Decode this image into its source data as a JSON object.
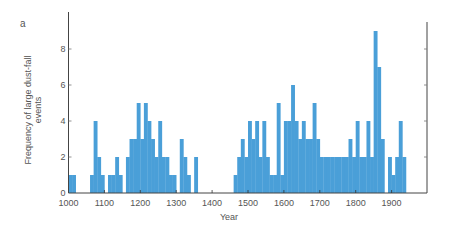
{
  "panel_label": "a",
  "chart_data": {
    "type": "bar",
    "title": "",
    "xlabel": "Year",
    "ylabel": "Frequency of large dust-fall events",
    "xlim": [
      1000,
      2000
    ],
    "ylim": [
      0,
      10
    ],
    "bin_width_years": 10,
    "x_ticks": [
      1000,
      1100,
      1200,
      1300,
      1400,
      1500,
      1600,
      1700,
      1800,
      1900
    ],
    "y_ticks": [
      0,
      2,
      4,
      6,
      8
    ],
    "grid": false,
    "legend": null,
    "color": "#4a9fd8",
    "x": [
      1000,
      1010,
      1020,
      1030,
      1040,
      1050,
      1060,
      1070,
      1080,
      1090,
      1100,
      1110,
      1120,
      1130,
      1140,
      1150,
      1160,
      1170,
      1180,
      1190,
      1200,
      1210,
      1220,
      1230,
      1240,
      1250,
      1260,
      1270,
      1280,
      1290,
      1300,
      1310,
      1320,
      1330,
      1340,
      1350,
      1360,
      1370,
      1380,
      1390,
      1400,
      1410,
      1420,
      1430,
      1440,
      1450,
      1460,
      1470,
      1480,
      1490,
      1500,
      1510,
      1520,
      1530,
      1540,
      1550,
      1560,
      1570,
      1580,
      1590,
      1600,
      1610,
      1620,
      1630,
      1640,
      1650,
      1660,
      1670,
      1680,
      1690,
      1700,
      1710,
      1720,
      1730,
      1740,
      1750,
      1760,
      1770,
      1780,
      1790,
      1800,
      1810,
      1820,
      1830,
      1840,
      1850,
      1860,
      1870,
      1880,
      1890,
      1900,
      1910,
      1920,
      1930
    ],
    "values": [
      1,
      1,
      0,
      0,
      0,
      0,
      1,
      4,
      2,
      1,
      0,
      1,
      1,
      2,
      1,
      0,
      2,
      3,
      3,
      5,
      3,
      5,
      4,
      3,
      2,
      4,
      2,
      2,
      1,
      1,
      0,
      3,
      2,
      1,
      0,
      2,
      0,
      0,
      0,
      0,
      0,
      0,
      0,
      0,
      0,
      0,
      1,
      2,
      3,
      2,
      4,
      3,
      4,
      2,
      4,
      2,
      1,
      1,
      5,
      1,
      4,
      4,
      6,
      4,
      3,
      4,
      3,
      3,
      5,
      3,
      2,
      2,
      2,
      2,
      2,
      2,
      2,
      2,
      3,
      2,
      4,
      2,
      2,
      4,
      2,
      9,
      7,
      3,
      0,
      2,
      1,
      2,
      4,
      2
    ]
  }
}
